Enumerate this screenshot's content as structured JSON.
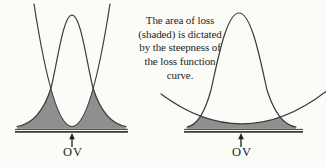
{
  "colors": {
    "background": "#fbfbf8",
    "curve_stroke": "#3a3a3a",
    "shade": "#8f8f8f",
    "text": "#1f1f1f"
  },
  "caption": {
    "lines": [
      "The area of loss",
      "(shaded) is dictated",
      "by the steepness of",
      "the loss function",
      "curve."
    ]
  },
  "figures": {
    "left": {
      "label": "OV",
      "loss_curve": "steep",
      "shaded_area": "large"
    },
    "right": {
      "label": "OV",
      "loss_curve": "shallow",
      "shaded_area": "small"
    }
  }
}
